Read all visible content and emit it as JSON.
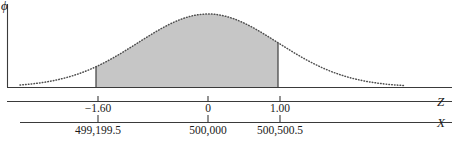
{
  "chart_data": {
    "type": "area",
    "title": "",
    "subtitle": "",
    "ylabel": "ϕ",
    "xlabel_primary": "Z",
    "xlabel_secondary": "X",
    "grid": false,
    "legend": null,
    "annotations": [],
    "shaded_region": {
      "from_z": -1.6,
      "to_z": 1.0,
      "fill_color": "#c6c6c6"
    },
    "axes": [
      {
        "name": "Z",
        "label": "Z",
        "ticks": [
          {
            "value": -1.6,
            "label": "−1.60",
            "px": 98
          },
          {
            "value": 0,
            "label": "0",
            "px": 208
          },
          {
            "value": 1.0,
            "label": "1.00",
            "px": 280
          }
        ]
      },
      {
        "name": "X",
        "label": "X",
        "ticks": [
          {
            "value": 499199.5,
            "label": "499,199.5",
            "px": 98
          },
          {
            "value": 500000,
            "label": "500,000",
            "px": 208
          },
          {
            "value": 500500.5,
            "label": "500,500.5",
            "px": 280
          }
        ]
      }
    ],
    "curve": {
      "style": "dotted",
      "color": "#4e4e4e",
      "distribution": "normal",
      "mean_px": 208,
      "peak_y_px": 14,
      "baseline_y_px": 87
    },
    "colors": {
      "fill": "#c6c6c6",
      "stroke": "#4e4e4e",
      "axis": "#3a3a3a",
      "text": "#1a1a1a",
      "background": "#ffffff"
    }
  },
  "figure": {
    "ylabel": "ϕ",
    "z_axis_label": "Z",
    "x_axis_label": "X",
    "z_ticks": [
      "−1.60",
      "0",
      "1.00"
    ],
    "x_ticks": [
      "499,199.5",
      "500,000",
      "500,500.5"
    ]
  }
}
